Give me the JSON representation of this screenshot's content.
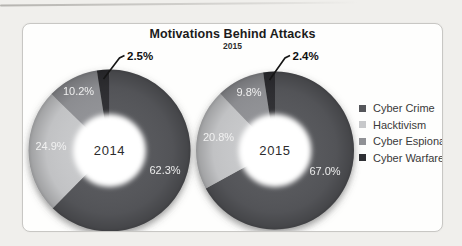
{
  "header": {
    "title": "Motivations Behind Attacks",
    "subtitle": "2015"
  },
  "legend": {
    "items": [
      {
        "label": "Cyber Crime",
        "color": "#55565a"
      },
      {
        "label": "Hacktivism",
        "color": "#c7c8ca"
      },
      {
        "label": "Cyber Espionage",
        "color": "#909195"
      },
      {
        "label": "Cyber Warfare",
        "color": "#2e2f33"
      }
    ]
  },
  "chart_data": [
    {
      "type": "pie",
      "subtype": "donut",
      "title": "Motivations Behind Attacks",
      "subtitle": "2015",
      "center_label": "2014",
      "categories": [
        "Cyber Crime",
        "Hacktivism",
        "Cyber Espionage",
        "Cyber Warfare"
      ],
      "values": [
        62.3,
        24.9,
        10.2,
        2.5
      ],
      "value_labels": [
        "62.3%",
        "24.9%",
        "10.2%",
        "2.5%"
      ],
      "colors": [
        "#55565a",
        "#c7c8ca",
        "#909195",
        "#2e2f33"
      ],
      "callout": {
        "category": "Cyber Warfare",
        "label": "2.5%"
      },
      "start_angle_deg": 0,
      "direction": "clockwise",
      "legend_position": "right"
    },
    {
      "type": "pie",
      "subtype": "donut",
      "title": "Motivations Behind Attacks",
      "subtitle": "2015",
      "center_label": "2015",
      "categories": [
        "Cyber Crime",
        "Hacktivism",
        "Cyber Espionage",
        "Cyber Warfare"
      ],
      "values": [
        67.0,
        20.8,
        9.8,
        2.4
      ],
      "value_labels": [
        "67.0%",
        "20.8%",
        "9.8%",
        "2.4%"
      ],
      "colors": [
        "#55565a",
        "#c7c8ca",
        "#909195",
        "#2e2f33"
      ],
      "callout": {
        "category": "Cyber Warfare",
        "label": "2.4%"
      },
      "start_angle_deg": 0,
      "direction": "clockwise",
      "legend_position": "right"
    }
  ]
}
